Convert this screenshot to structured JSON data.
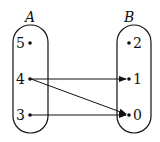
{
  "sets": {
    "A": {
      "label": "A",
      "elements": [
        "5",
        "4",
        "3"
      ]
    },
    "B": {
      "label": "B",
      "elements": [
        "2",
        "1",
        "0"
      ]
    }
  },
  "mapping": [
    {
      "from": "4",
      "to": "1"
    },
    {
      "from": "4",
      "to": "0"
    },
    {
      "from": "3",
      "to": "0"
    }
  ]
}
